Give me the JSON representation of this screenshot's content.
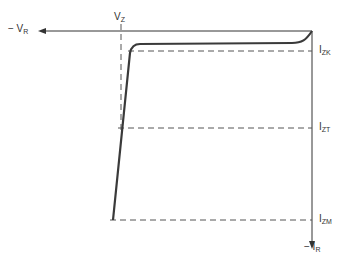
{
  "diagram": {
    "labels": {
      "neg_vr": {
        "main": "− V",
        "sub": "R"
      },
      "vz": {
        "main": "V",
        "sub": "Z"
      },
      "izk": {
        "main": "I",
        "sub": "ZK"
      },
      "izt": {
        "main": "I",
        "sub": "ZT"
      },
      "izm": {
        "main": "I",
        "sub": "ZM"
      },
      "neg_ir": {
        "main": "− I",
        "sub": "R"
      }
    },
    "colors": {
      "line": "#333333",
      "curve": "#3a3a3a",
      "dashed": "#555555"
    }
  }
}
